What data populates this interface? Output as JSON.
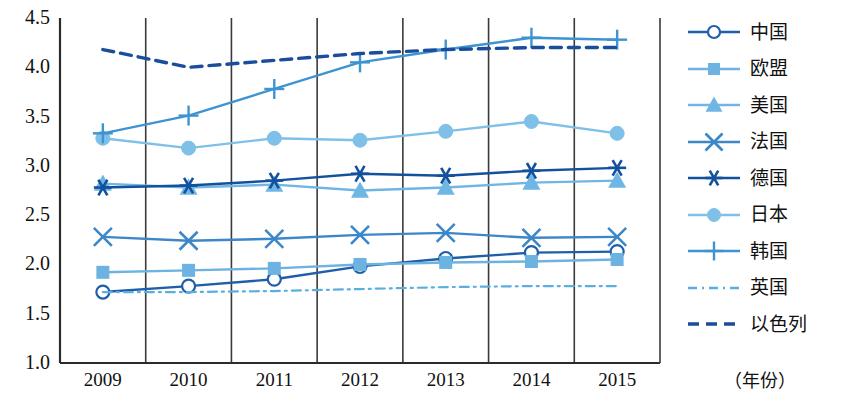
{
  "chart_data": {
    "type": "line",
    "title": "",
    "xlabel": "（年份）",
    "ylabel": "",
    "categories": [
      "2009",
      "2010",
      "2011",
      "2012",
      "2013",
      "2014",
      "2015"
    ],
    "ylim": [
      1.0,
      4.5
    ],
    "ytick_labels": [
      "4.5",
      "4.0",
      "3.5",
      "3.0",
      "2.5",
      "2.0",
      "1.5",
      "1.0"
    ],
    "ytick_values": [
      4.5,
      4.0,
      3.5,
      3.0,
      2.5,
      2.0,
      1.5,
      1.0
    ],
    "grid": "vertical",
    "legend_position": "right",
    "series": [
      {
        "name": "中国",
        "marker": "open-circle",
        "color": "#1F5FA9",
        "dash": "solid",
        "values": [
          1.72,
          1.78,
          1.85,
          1.98,
          2.06,
          2.12,
          2.13
        ]
      },
      {
        "name": "欧盟",
        "marker": "filled-square",
        "color": "#6DB3E2",
        "dash": "solid",
        "values": [
          1.92,
          1.94,
          1.96,
          2.0,
          2.02,
          2.03,
          2.05
        ]
      },
      {
        "name": "美国",
        "marker": "filled-triangle",
        "color": "#6FB6E4",
        "dash": "solid",
        "values": [
          2.82,
          2.78,
          2.81,
          2.75,
          2.78,
          2.83,
          2.85
        ]
      },
      {
        "name": "法国",
        "marker": "cross-x",
        "color": "#3C87C8",
        "dash": "solid",
        "values": [
          2.28,
          2.24,
          2.26,
          2.3,
          2.32,
          2.27,
          2.28
        ]
      },
      {
        "name": "德国",
        "marker": "asterisk",
        "color": "#14519C",
        "dash": "solid",
        "values": [
          2.78,
          2.8,
          2.85,
          2.92,
          2.9,
          2.95,
          2.98
        ]
      },
      {
        "name": "日本",
        "marker": "filled-circle",
        "color": "#7FC0E8",
        "dash": "solid",
        "values": [
          3.28,
          3.18,
          3.28,
          3.26,
          3.35,
          3.45,
          3.33
        ]
      },
      {
        "name": "韩国",
        "marker": "plus",
        "color": "#3E93D1",
        "dash": "solid",
        "values": [
          3.33,
          3.51,
          3.78,
          4.05,
          4.18,
          4.3,
          4.28
        ]
      },
      {
        "name": "英国",
        "marker": "none",
        "color": "#5AAEE0",
        "dash": "dash-dot",
        "values": [
          1.72,
          1.72,
          1.73,
          1.75,
          1.77,
          1.78,
          1.78
        ]
      },
      {
        "name": "以色列",
        "marker": "none",
        "color": "#1A4E9C",
        "dash": "dashed",
        "values": [
          4.18,
          4.0,
          4.07,
          4.14,
          4.18,
          4.2,
          4.2
        ]
      }
    ]
  },
  "axis": {
    "unit_label": "（年份）"
  }
}
